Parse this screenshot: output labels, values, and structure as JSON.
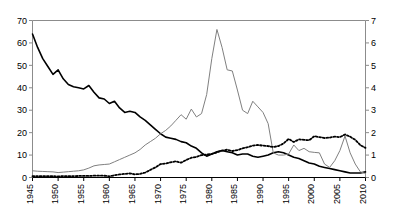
{
  "chart_data": {
    "type": "line",
    "title": "",
    "subtitle": "",
    "xlabel": "",
    "ylabel": "",
    "y2label": "",
    "grid": false,
    "legend": "none",
    "xlim": [
      1945,
      2010
    ],
    "ylim": [
      0,
      70
    ],
    "y2lim": [
      0,
      7
    ],
    "xticks": [
      1945,
      1950,
      1955,
      1960,
      1965,
      1970,
      1975,
      1980,
      1985,
      1990,
      1995,
      2000,
      2005,
      2010
    ],
    "yticks": [
      0,
      10,
      20,
      30,
      40,
      50,
      60,
      70
    ],
    "y2ticks": [
      0,
      1,
      2,
      3,
      4,
      5,
      6,
      7
    ],
    "xtick_labels": [
      "1945",
      "1950",
      "1955",
      "1960",
      "1965",
      "1970",
      "1975",
      "1980",
      "1985",
      "1990",
      "1995",
      "2000",
      "2005",
      "2010"
    ],
    "ytick_labels": [
      "0",
      "10",
      "20",
      "30",
      "40",
      "50",
      "60",
      "70"
    ],
    "y2tick_labels": [
      "0",
      "1",
      "2",
      "3",
      "4",
      "5",
      "6",
      "7"
    ],
    "x": [
      1945,
      1946,
      1947,
      1948,
      1949,
      1950,
      1951,
      1952,
      1953,
      1954,
      1955,
      1956,
      1957,
      1958,
      1959,
      1960,
      1961,
      1962,
      1963,
      1964,
      1965,
      1966,
      1967,
      1968,
      1969,
      1970,
      1971,
      1972,
      1973,
      1974,
      1975,
      1976,
      1977,
      1978,
      1979,
      1980,
      1981,
      1982,
      1983,
      1984,
      1985,
      1986,
      1987,
      1988,
      1989,
      1990,
      1991,
      1992,
      1993,
      1994,
      1995,
      1996,
      1997,
      1998,
      1999,
      2000,
      2001,
      2002,
      2003,
      2004,
      2005,
      2006,
      2007,
      2008,
      2009,
      2010
    ],
    "series": [
      {
        "name": "series-1-solid-black",
        "axis": "left",
        "style": "solid",
        "color": "#000000",
        "width": 1.6,
        "values": [
          64.0,
          58.0,
          53.0,
          49.5,
          46.0,
          48.0,
          44.0,
          41.5,
          40.5,
          40.0,
          39.5,
          41.0,
          38.0,
          35.5,
          35.0,
          33.0,
          34.0,
          31.0,
          29.0,
          29.5,
          29.0,
          27.0,
          25.5,
          23.5,
          21.5,
          19.5,
          18.0,
          17.5,
          17.0,
          16.0,
          15.5,
          14.0,
          13.0,
          11.0,
          9.5,
          10.5,
          11.5,
          12.0,
          11.5,
          11.0,
          10.0,
          10.5,
          10.5,
          9.5,
          9.0,
          9.5,
          10.0,
          11.0,
          11.5,
          11.0,
          10.0,
          9.0,
          8.5,
          7.5,
          6.5,
          6.0,
          5.0,
          4.5,
          4.0,
          3.5,
          3.0,
          2.5,
          2.0,
          2.0,
          2.0,
          2.5
        ]
      },
      {
        "name": "series-2-thin-gray",
        "axis": "right",
        "style": "solid",
        "color": "#808080",
        "width": 1.0,
        "values": [
          0.3,
          0.28,
          0.27,
          0.26,
          0.25,
          0.22,
          0.24,
          0.26,
          0.28,
          0.3,
          0.34,
          0.42,
          0.52,
          0.56,
          0.58,
          0.6,
          0.7,
          0.8,
          0.9,
          1.0,
          1.1,
          1.25,
          1.45,
          1.6,
          1.75,
          1.95,
          2.1,
          2.3,
          2.55,
          2.8,
          2.6,
          3.05,
          2.7,
          2.85,
          3.7,
          5.3,
          6.6,
          5.8,
          4.8,
          4.75,
          3.9,
          3.0,
          2.85,
          3.4,
          3.15,
          2.9,
          2.4,
          1.1,
          1.0,
          1.0,
          1.05,
          1.45,
          1.2,
          1.3,
          1.15,
          1.12,
          1.1,
          0.6,
          0.45,
          0.75,
          1.2,
          1.85,
          1.1,
          0.6,
          0.25,
          0.18
        ]
      },
      {
        "name": "series-3-dotted-black",
        "axis": "right",
        "style": "dotted",
        "color": "#000000",
        "width": 1.8,
        "values": [
          0.06,
          0.06,
          0.06,
          0.06,
          0.06,
          0.05,
          0.06,
          0.06,
          0.06,
          0.07,
          0.07,
          0.07,
          0.08,
          0.08,
          0.08,
          0.05,
          0.1,
          0.14,
          0.16,
          0.18,
          0.14,
          0.16,
          0.22,
          0.34,
          0.45,
          0.6,
          0.62,
          0.68,
          0.72,
          0.66,
          0.78,
          0.88,
          0.92,
          1.0,
          1.02,
          1.05,
          1.12,
          1.2,
          1.24,
          1.18,
          1.22,
          1.3,
          1.35,
          1.42,
          1.45,
          1.42,
          1.4,
          1.36,
          1.4,
          1.52,
          1.72,
          1.58,
          1.7,
          1.68,
          1.66,
          1.84,
          1.8,
          1.76,
          1.78,
          1.82,
          1.8,
          1.92,
          1.82,
          1.68,
          1.44,
          1.32
        ]
      }
    ]
  }
}
